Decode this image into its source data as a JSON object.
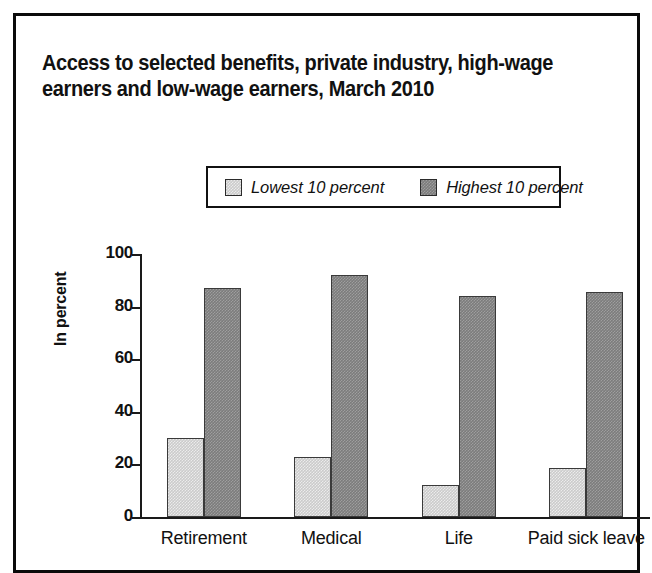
{
  "figure": {
    "title": "Access to selected benefits, private industry, high-wage\nearners and low-wage earners, March 2010"
  },
  "legend": {
    "entries": [
      {
        "label": "Lowest 10 percent",
        "swatch_name": "legend-swatch-lowest",
        "color": "#cbcbcb"
      },
      {
        "label": "Highest 10 percent",
        "swatch_name": "legend-swatch-highest",
        "color": "#7c7c7c"
      }
    ]
  },
  "axes": {
    "y_title": "In percent",
    "y_ticks": [
      "0",
      "20",
      "40",
      "60",
      "80",
      "100"
    ]
  },
  "chart_data": {
    "type": "bar",
    "title": "Access to selected benefits, private industry, high-wage earners and low-wage earners, March 2010",
    "xlabel": "",
    "ylabel": "In percent",
    "ylim": [
      0,
      100
    ],
    "yticks": [
      0,
      20,
      40,
      60,
      80,
      100
    ],
    "grid": false,
    "legend_position": "top-center",
    "categories": [
      "Retirement",
      "Medical",
      "Life",
      "Paid sick leave"
    ],
    "series": [
      {
        "name": "Lowest 10 percent",
        "color": "#cbcbcb",
        "values": [
          30,
          23,
          12,
          18.5
        ]
      },
      {
        "name": "Highest 10 percent",
        "color": "#7c7c7c",
        "values": [
          87,
          92,
          84,
          85.5
        ]
      }
    ]
  }
}
